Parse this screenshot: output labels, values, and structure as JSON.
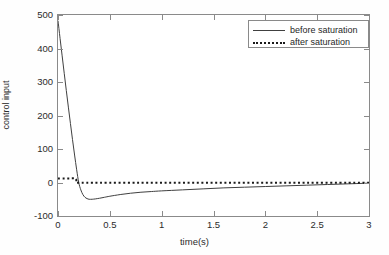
{
  "chart_data": {
    "type": "line",
    "title": "",
    "xlabel": "time(s)",
    "ylabel": "control input",
    "xlim": [
      0,
      3
    ],
    "ylim": [
      -100,
      500
    ],
    "xticks": [
      "0",
      "0.5",
      "1",
      "1.5",
      "2",
      "2.5",
      "3"
    ],
    "xtick_values": [
      0,
      0.5,
      1,
      1.5,
      2,
      2.5,
      3
    ],
    "yticks": [
      "-100",
      "0",
      "100",
      "200",
      "300",
      "400",
      "500"
    ],
    "ytick_values": [
      -100,
      0,
      100,
      200,
      300,
      400,
      500
    ],
    "grid": false,
    "legend_position": "upper right",
    "series": [
      {
        "name": "before saturation",
        "style": "solid",
        "color": "#404040",
        "x": [
          0.0,
          0.02,
          0.04,
          0.06,
          0.08,
          0.1,
          0.12,
          0.14,
          0.16,
          0.18,
          0.2,
          0.22,
          0.24,
          0.26,
          0.28,
          0.3,
          0.33,
          0.36,
          0.4,
          0.45,
          0.5,
          0.6,
          0.7,
          0.8,
          0.9,
          1.0,
          1.2,
          1.4,
          1.6,
          1.8,
          2.0,
          2.2,
          2.4,
          2.6,
          2.8,
          3.0
        ],
        "y": [
          483,
          430,
          378,
          326,
          275,
          225,
          176,
          128,
          82,
          38,
          0,
          -22,
          -36,
          -44,
          -48,
          -50,
          -50,
          -49,
          -47,
          -44,
          -41,
          -36,
          -32,
          -29,
          -27,
          -25,
          -22,
          -19,
          -16,
          -14,
          -12,
          -10,
          -8,
          -6,
          -4,
          -2
        ]
      },
      {
        "name": "after saturation",
        "style": "dotted",
        "color": "#1a1a1a",
        "x": [
          0.0,
          0.06,
          0.12,
          0.17,
          0.18,
          0.2,
          0.4,
          0.8,
          1.2,
          1.6,
          2.0,
          2.4,
          2.8,
          3.0
        ],
        "y": [
          12,
          12,
          12,
          12,
          0,
          -1,
          -1,
          -1,
          -1,
          -1,
          -1,
          -1,
          -1,
          -1
        ]
      }
    ]
  },
  "legend": {
    "items": [
      {
        "label": "before saturation",
        "style": "solid"
      },
      {
        "label": "after saturation",
        "style": "dotted"
      }
    ]
  },
  "axes": {
    "x_title": "time(s)",
    "y_title": "control input"
  }
}
